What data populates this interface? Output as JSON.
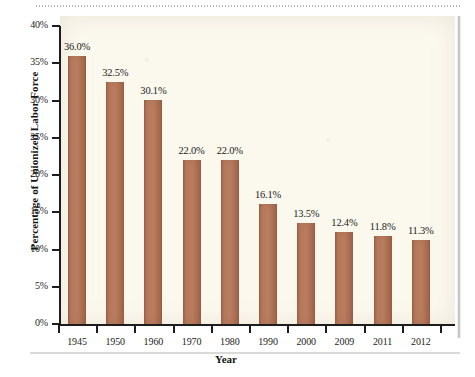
{
  "chart_data": {
    "type": "bar",
    "title": "",
    "xlabel": "Year",
    "ylabel": "Percentage of Unionized Labor Force",
    "categories": [
      "1945",
      "1950",
      "1960",
      "1970",
      "1980",
      "1990",
      "2000",
      "2009",
      "2011",
      "2012"
    ],
    "values": [
      36.0,
      32.5,
      30.1,
      22.0,
      22.0,
      16.1,
      13.5,
      12.4,
      11.8,
      11.3
    ],
    "value_labels": [
      "36.0%",
      "32.5%",
      "30.1%",
      "22.0%",
      "22.0%",
      "16.1%",
      "13.5%",
      "12.4%",
      "11.8%",
      "11.3%"
    ],
    "ylim": [
      0,
      40
    ],
    "ytick_values": [
      0,
      5,
      10,
      15,
      20,
      25,
      30,
      35,
      40
    ],
    "ytick_labels": [
      "0%",
      "5%",
      "10%",
      "15%",
      "20%",
      "25%",
      "30%",
      "35%",
      "40%"
    ],
    "grid": false,
    "legend": false,
    "bar_color": "#b07355",
    "plot_background": "#fbf8ee",
    "axis_color": "#1d1d1b"
  }
}
